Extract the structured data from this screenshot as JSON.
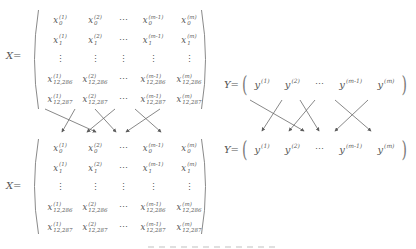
{
  "colors": {
    "background": "#ffffff",
    "text": "#565656",
    "paren": "#8a8a8a",
    "arrow": "#5e5e5e"
  },
  "matrix_x_top": {
    "label": "X=",
    "rows": [
      [
        {
          "b": "x",
          "sub": "0",
          "sup": "(1)"
        },
        {
          "b": "x",
          "sub": "0",
          "sup": "(2)"
        },
        {
          "dots": "⋯"
        },
        {
          "b": "x",
          "sub": "0",
          "sup": "(m-1)"
        },
        {
          "b": "x",
          "sub": "0",
          "sup": "(m)"
        }
      ],
      [
        {
          "b": "x",
          "sub": "1",
          "sup": "(1)"
        },
        {
          "b": "x",
          "sub": "1",
          "sup": "(2)"
        },
        {
          "dots": "⋯"
        },
        {
          "b": "x",
          "sub": "1",
          "sup": "(m-1)"
        },
        {
          "b": "x",
          "sub": "1",
          "sup": "(m)"
        }
      ],
      [
        {
          "dots": "⋮"
        },
        {
          "dots": "⋮"
        },
        {
          "dots": "⋮"
        },
        {
          "dots": "⋮"
        },
        {
          "dots": "⋮"
        }
      ],
      [
        {
          "b": "x",
          "sub": "12,286",
          "sup": "(1)"
        },
        {
          "b": "x",
          "sub": "12,286",
          "sup": "(2)"
        },
        {
          "dots": "⋯"
        },
        {
          "b": "x",
          "sub": "12,286",
          "sup": "(m-1)"
        },
        {
          "b": "x",
          "sub": "12,286",
          "sup": "(m)"
        }
      ],
      [
        {
          "b": "x",
          "sub": "12,287",
          "sup": "(1)"
        },
        {
          "b": "x",
          "sub": "12,287",
          "sup": "(2)"
        },
        {
          "dots": "⋯"
        },
        {
          "b": "x",
          "sub": "12,287",
          "sup": "(m-1)"
        },
        {
          "b": "x",
          "sub": "12,287",
          "sup": "(m)"
        }
      ]
    ]
  },
  "matrix_x_bottom": {
    "label": "X=",
    "rows": [
      [
        {
          "b": "x",
          "sub": "0",
          "sup": "(1)"
        },
        {
          "b": "x",
          "sub": "0",
          "sup": "(2)"
        },
        {
          "dots": "⋯"
        },
        {
          "b": "x",
          "sub": "0",
          "sup": "(m-1)"
        },
        {
          "b": "x",
          "sub": "0",
          "sup": "(m)"
        }
      ],
      [
        {
          "b": "x",
          "sub": "1",
          "sup": "(1)"
        },
        {
          "b": "x",
          "sub": "1",
          "sup": "(2)"
        },
        {
          "dots": "⋯"
        },
        {
          "b": "x",
          "sub": "1",
          "sup": "(m-1)"
        },
        {
          "b": "x",
          "sub": "1",
          "sup": "(m)"
        }
      ],
      [
        {
          "dots": "⋮"
        },
        {
          "dots": "⋮"
        },
        {
          "dots": "⋮"
        },
        {
          "dots": "⋮"
        },
        {
          "dots": "⋮"
        }
      ],
      [
        {
          "b": "x",
          "sub": "12,286",
          "sup": "(1)"
        },
        {
          "b": "x",
          "sub": "12,286",
          "sup": "(2)"
        },
        {
          "dots": "⋯"
        },
        {
          "b": "x",
          "sub": "12,286",
          "sup": "(m-1)"
        },
        {
          "b": "x",
          "sub": "12,286",
          "sup": "(m)"
        }
      ],
      [
        {
          "b": "x",
          "sub": "12,287",
          "sup": "(1)"
        },
        {
          "b": "x",
          "sub": "12,287",
          "sup": "(2)"
        },
        {
          "dots": "⋯"
        },
        {
          "b": "x",
          "sub": "12,287",
          "sup": "(m-1)"
        },
        {
          "b": "x",
          "sub": "12,287",
          "sup": "(m)"
        }
      ]
    ]
  },
  "vector_y_top": {
    "label": "Y=",
    "paren_open": "(",
    "paren_close": ")",
    "entries": [
      {
        "b": "y",
        "sup": "(1)"
      },
      {
        "b": "y",
        "sup": "(2)"
      },
      {
        "dots": "⋯"
      },
      {
        "b": "y",
        "sup": "(m-1)"
      },
      {
        "b": "y",
        "sup": "(m)"
      }
    ]
  },
  "vector_y_bottom": {
    "label": "Y=",
    "paren_open": "(",
    "paren_close": ")",
    "entries": [
      {
        "b": "y",
        "sup": "(1)"
      },
      {
        "b": "y",
        "sup": "(2)"
      },
      {
        "dots": "⋯"
      },
      {
        "b": "y",
        "sup": "(m-1)"
      },
      {
        "b": "y",
        "sup": "(m)"
      }
    ]
  }
}
